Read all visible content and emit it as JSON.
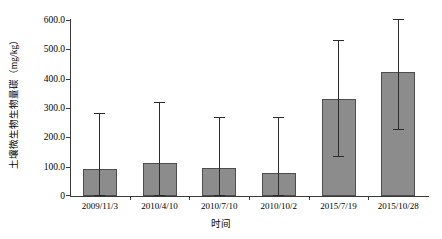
{
  "chart_data": {
    "type": "bar",
    "title": "",
    "xlabel": "时间",
    "ylabel": "土壤微生物生物量碳（mg/kg）",
    "categories": [
      "2009/11/3",
      "2010/4/10",
      "2010/7/10",
      "2010/10/2",
      "2015/7/19",
      "2015/10/28"
    ],
    "values": [
      93,
      113,
      97,
      79,
      331,
      423
    ],
    "errors": [
      55,
      60,
      50,
      55,
      58,
      58
    ],
    "ylim": [
      0,
      600
    ],
    "yticks": [
      0,
      100,
      200,
      300,
      400,
      500,
      600
    ],
    "ytick_labels": [
      "0",
      "100.0",
      "200.0",
      "300.0",
      "400.0",
      "500.0",
      "600.0"
    ],
    "grid": false,
    "legend": "none",
    "bar_color": "#8c8c8c",
    "bar_edge_color": "#4d4d4d",
    "error_color": "#2b2b2b",
    "axis_color": "#3a3a3a"
  }
}
